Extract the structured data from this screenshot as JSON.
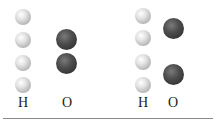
{
  "diagram": {
    "groups": [
      {
        "id": "left",
        "hydrogen_label": "H",
        "oxygen_label": "O",
        "hydrogen_count": 4,
        "oxygen_count": 2
      },
      {
        "id": "right",
        "hydrogen_label": "H",
        "oxygen_label": "O",
        "hydrogen_count": 4,
        "oxygen_count": 2
      }
    ],
    "colors": {
      "hydrogen": "#d0d0d0",
      "oxygen": "#3c3c3c",
      "rule": "#8a8a8a"
    }
  }
}
